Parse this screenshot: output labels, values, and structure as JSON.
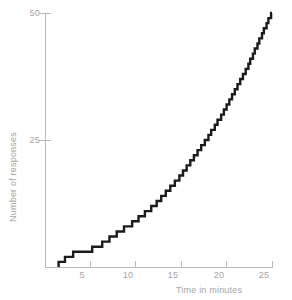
{
  "chart_data": {
    "type": "line",
    "subtype": "cumulative-step-record",
    "title": "",
    "xlabel": "Time in minutes",
    "ylabel": "Number of responses",
    "xlim": [
      0,
      25
    ],
    "ylim": [
      0,
      50
    ],
    "xticks": [
      5,
      10,
      15,
      20,
      25
    ],
    "xtick_labels": [
      "5",
      "10",
      "15",
      "20",
      "25"
    ],
    "yticks": [
      25,
      50
    ],
    "ytick_labels": [
      "25",
      "50"
    ],
    "grid": false,
    "legend": null,
    "series": [
      {
        "name": "Cumulative responses",
        "color": "#1b1b1b",
        "step_type": "post",
        "x": [
          1.5,
          2.2,
          3.1,
          5.2,
          6.3,
          7.1,
          7.9,
          8.7,
          9.6,
          10.3,
          11.0,
          11.7,
          12.3,
          12.8,
          13.3,
          13.8,
          14.3,
          14.8,
          15.2,
          15.6,
          16.0,
          16.4,
          16.8,
          17.2,
          17.6,
          18.0,
          18.3,
          18.7,
          19.0,
          19.4,
          19.7,
          20.0,
          20.3,
          20.6,
          20.9,
          21.2,
          21.5,
          21.8,
          22.1,
          22.4,
          22.6,
          22.9,
          23.1,
          23.4,
          23.6,
          23.9,
          24.1,
          24.4,
          24.6,
          24.9
        ],
        "y": [
          1,
          2,
          3,
          4,
          5,
          6,
          7,
          8,
          9,
          10,
          11,
          12,
          13,
          14,
          15,
          16,
          17,
          18,
          19,
          20,
          21,
          22,
          23,
          24,
          25,
          26,
          27,
          28,
          29,
          30,
          31,
          32,
          33,
          34,
          35,
          36,
          37,
          38,
          39,
          40,
          41,
          42,
          43,
          44,
          45,
          46,
          47,
          48,
          49,
          50
        ]
      }
    ],
    "axis_color": "#b9b9b9",
    "text_color": "#a5a5a5",
    "background": "#ffffff"
  },
  "geometry": {
    "x0_px": 45,
    "x25_px": 272,
    "y0_px": 267,
    "y50_px": 13
  }
}
